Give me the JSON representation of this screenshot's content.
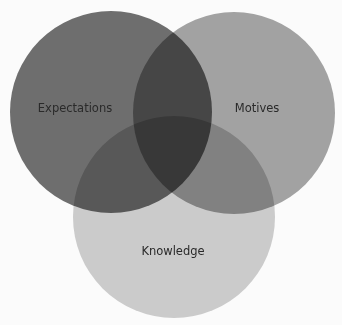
{
  "diagram": {
    "type": "venn",
    "circles": [
      {
        "label": "Expectations",
        "cx": 111,
        "cy": 112,
        "r": 101,
        "color": "#6e6e6e"
      },
      {
        "label": "Motives",
        "cx": 234,
        "cy": 113,
        "r": 101,
        "color": "#a2a2a2"
      },
      {
        "label": "Knowledge",
        "cx": 174,
        "cy": 217,
        "r": 101,
        "color": "#cbcbcb"
      }
    ],
    "labels": {
      "expectations": "Expectations",
      "motives": "Motives",
      "knowledge": "Knowledge"
    }
  }
}
